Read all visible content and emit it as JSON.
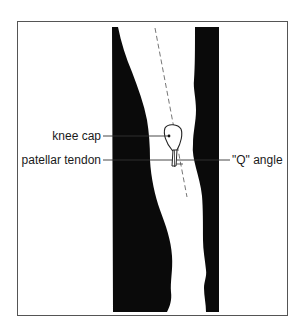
{
  "diagram": {
    "labels": {
      "knee_cap": "knee cap",
      "patellar_tendon": "patellar tendon",
      "q_angle": "\"Q\" angle"
    },
    "colors": {
      "silhouette": "#0a0a0a",
      "frame": "#555555",
      "leader_line": "#333333",
      "axis_line": "#666666",
      "background": "#ffffff"
    }
  }
}
